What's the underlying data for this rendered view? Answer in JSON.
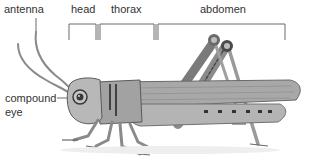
{
  "diagram": {
    "labels": {
      "antenna": "antenna",
      "head": "head",
      "thorax": "thorax",
      "abdomen": "abdomen",
      "compound_eye_line1": "compound",
      "compound_eye_line2": "eye"
    },
    "colors": {
      "label_text": "#333333",
      "bracket_line": "#666666",
      "body_light": "#bfbfbf",
      "body_mid": "#9a9a9a",
      "body_dark": "#5a5a5a"
    }
  }
}
